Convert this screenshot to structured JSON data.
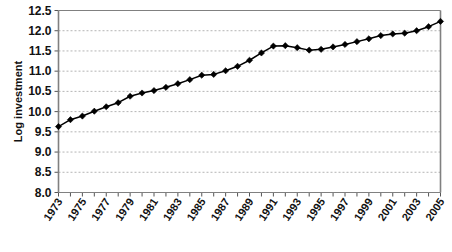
{
  "chart_data": {
    "type": "line",
    "title": "",
    "xlabel": "",
    "ylabel": "Log investment",
    "ylim": [
      8.0,
      12.5
    ],
    "xlim": [
      1973,
      2005
    ],
    "grid": true,
    "grid_axis": "y",
    "legend": false,
    "marker": "diamond",
    "line_color": "#000000",
    "marker_color": "#000000",
    "grid_color": "#b4b4b4",
    "axis_color": "#808080",
    "yticks": [
      "8.0",
      "8.5",
      "9.0",
      "9.5",
      "10.0",
      "10.5",
      "11.0",
      "11.5",
      "12.0",
      "12.5"
    ],
    "ytick_values": [
      8.0,
      8.5,
      9.0,
      9.5,
      10.0,
      10.5,
      11.0,
      11.5,
      12.0,
      12.5
    ],
    "xtick_labels": [
      "1973",
      "1975",
      "1977",
      "1979",
      "1981",
      "1983",
      "1985",
      "1987",
      "1989",
      "1991",
      "1993",
      "1995",
      "1997",
      "1999",
      "2001",
      "2003",
      "2005"
    ],
    "x": [
      1973,
      1974,
      1975,
      1976,
      1977,
      1978,
      1979,
      1980,
      1981,
      1982,
      1983,
      1984,
      1985,
      1986,
      1987,
      1988,
      1989,
      1990,
      1991,
      1992,
      1993,
      1994,
      1995,
      1996,
      1997,
      1998,
      1999,
      2000,
      2001,
      2002,
      2003,
      2004,
      2005
    ],
    "values": [
      9.63,
      9.8,
      9.89,
      10.01,
      10.12,
      10.22,
      10.38,
      10.46,
      10.52,
      10.6,
      10.69,
      10.79,
      10.9,
      10.92,
      11.01,
      11.12,
      11.27,
      11.45,
      11.62,
      11.63,
      11.58,
      11.52,
      11.54,
      11.6,
      11.66,
      11.73,
      11.8,
      11.88,
      11.92,
      11.94,
      12.0,
      12.1,
      12.23
    ]
  }
}
